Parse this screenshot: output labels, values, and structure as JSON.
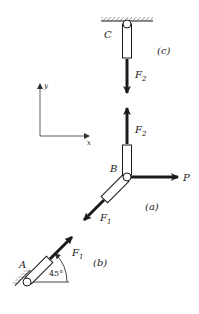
{
  "diagram": {
    "axes": {
      "x_label": "x",
      "y_label": "y"
    },
    "points": {
      "A": "A",
      "B": "B",
      "C": "C"
    },
    "parts": {
      "a": "(a)",
      "b": "(b)",
      "c": "(c)"
    },
    "forces": {
      "F1": "F",
      "F1_sub": "1",
      "F2": "F",
      "F2_sub": "2",
      "P": "P"
    },
    "angle": "45°",
    "colors": {
      "ink": "#1a1a1a",
      "hatch": "#777777"
    }
  }
}
